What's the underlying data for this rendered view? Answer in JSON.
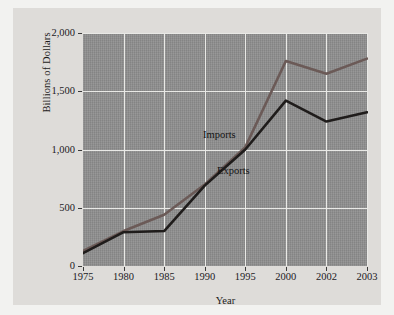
{
  "figure": {
    "background_color": "#f2f2f0",
    "card_color": "#dedcd9",
    "plot_background_color": "#8e8e8e",
    "gridline_color": "#e9e9e6"
  },
  "chart_data": {
    "type": "line",
    "title": "",
    "xlabel": "Year",
    "ylabel": "Billions of Dollars",
    "categories": [
      "1975",
      "1980",
      "1985",
      "1990",
      "1995",
      "2000",
      "2002",
      "2003"
    ],
    "ylim": [
      0,
      2000
    ],
    "yticks": [
      0,
      500,
      1000,
      1500,
      2000
    ],
    "ytick_labels": [
      "0",
      "500",
      "1,000",
      "1,500",
      "2,000"
    ],
    "grid": true,
    "legend_position": "inline-annotations",
    "series": [
      {
        "name": "Imports",
        "color": "#6b5a57",
        "values": [
          130,
          300,
          440,
          700,
          1020,
          1760,
          1650,
          1780
        ]
      },
      {
        "name": "Exports",
        "color": "#1f1c1b",
        "values": [
          110,
          290,
          300,
          690,
          1000,
          1420,
          1240,
          1320
        ]
      }
    ],
    "annotations": [
      {
        "text": "Imports",
        "series": "Imports"
      },
      {
        "text": "Exports",
        "series": "Exports"
      }
    ]
  }
}
